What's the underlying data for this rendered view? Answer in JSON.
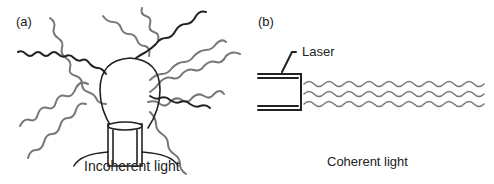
{
  "panel_a": {
    "label": "(a)",
    "caption": "Incoherent light",
    "source": "light-bulb"
  },
  "panel_b": {
    "label": "(b)",
    "caption": "Coherent light",
    "source_label": "Laser"
  },
  "colors": {
    "stroke_dark": "#222222",
    "stroke_gray": "#777777",
    "background": "#ffffff"
  }
}
